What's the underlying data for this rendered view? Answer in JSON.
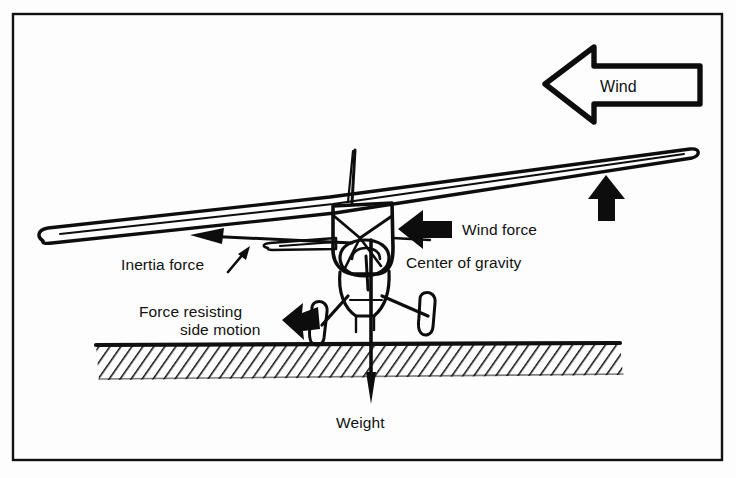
{
  "figure": {
    "background_color": "#fdfdfd",
    "ink_color": "#0d0d0d",
    "frame": {
      "x": 13,
      "y": 14,
      "width": 709,
      "height": 446
    }
  },
  "labels": {
    "wind": "Wind",
    "wind_force": "Wind force",
    "center_of_gravity": "Center of gravity",
    "inertia_force": "Inertia force",
    "force_resisting_line1": "Force resisting",
    "force_resisting_line2": "side motion",
    "weight": "Weight"
  },
  "elements": {
    "wind_arrow": {
      "name": "wind-arrow-outline",
      "style": "outlined-block-arrow",
      "direction": "left",
      "label": "Wind"
    },
    "wind_force_arrow": {
      "name": "wind-force-arrow",
      "style": "solid-arrow",
      "direction": "left",
      "label": "Wind force"
    },
    "lift_arrow": {
      "name": "wing-lift-arrow",
      "style": "solid-arrow",
      "direction": "up",
      "label": ""
    },
    "side_force_arrow": {
      "name": "side-resisting-force-arrow",
      "style": "solid-arrow",
      "direction": "left",
      "label": "Force resisting side motion"
    },
    "inertia_arrow": {
      "name": "inertia-force-arrow",
      "style": "line-arrow",
      "direction": "left",
      "label": "Inertia force"
    },
    "weight_arrow": {
      "name": "weight-arrow",
      "style": "line-arrow",
      "direction": "down",
      "label": "Weight"
    },
    "ground": {
      "name": "ground-hatching",
      "style": "diagonal-hatch-band"
    },
    "aircraft": {
      "name": "aircraft-front-view",
      "parts": [
        "wing",
        "fuselage",
        "antenna-mast",
        "horizontal-stabilizer",
        "propeller",
        "landing-gear",
        "wheels"
      ]
    }
  }
}
